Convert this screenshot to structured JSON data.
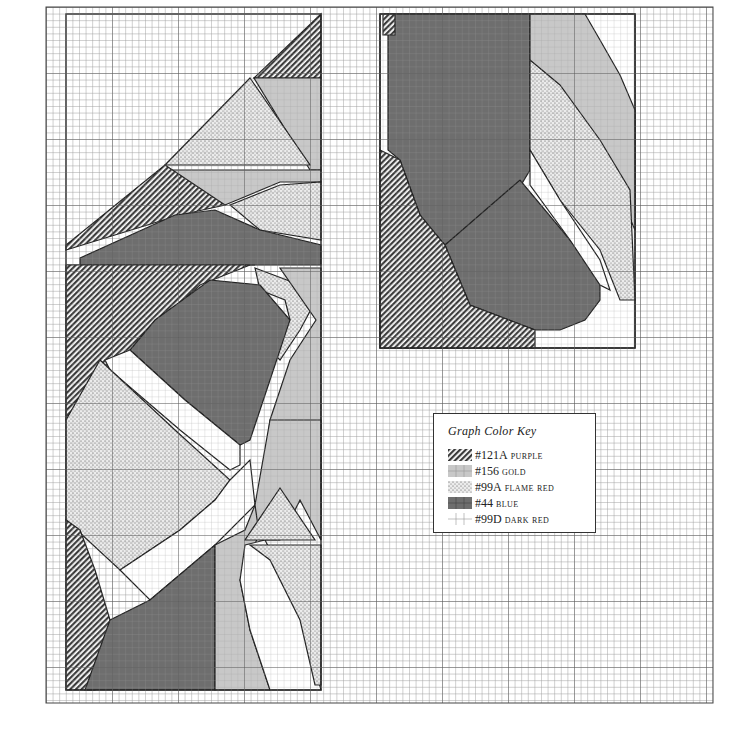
{
  "chart": {
    "grid": {
      "left": 46,
      "top": 7,
      "right": 713,
      "bottom": 703,
      "cell": 6.6,
      "major_every": 10
    },
    "panels": [
      {
        "name": "left-panel",
        "x": 66,
        "y": 14,
        "width": 255,
        "height": 676
      },
      {
        "name": "right-panel",
        "x": 380,
        "y": 14,
        "width": 255,
        "height": 334
      }
    ]
  },
  "key": {
    "title": "Graph Color Key",
    "items": [
      {
        "code": "#121A",
        "name": "purple",
        "pattern": "diagonal-hatch",
        "color": "#4a4a4a"
      },
      {
        "code": "#156",
        "name": "gold",
        "pattern": "light-gray",
        "color": "#c8c8c8"
      },
      {
        "code": "#99A",
        "name": "flame red",
        "pattern": "dotted",
        "color": "#e6e6e6"
      },
      {
        "code": "#44",
        "name": "blue",
        "pattern": "dark-gray",
        "color": "#6e6e6e"
      },
      {
        "code": "#99D",
        "name": "dark red",
        "pattern": "blank-grid",
        "color": "#ffffff"
      }
    ]
  }
}
